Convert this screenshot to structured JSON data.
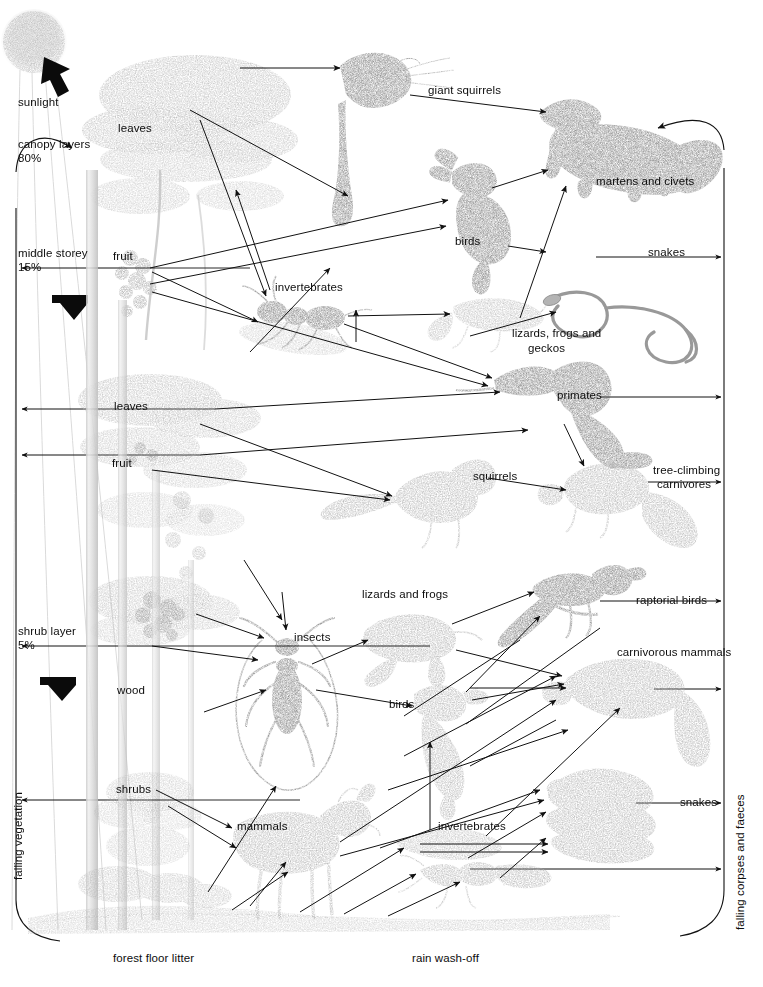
{
  "diagram": {
    "type": "food-web",
    "width": 763,
    "height": 987,
    "background": "#ffffff",
    "ink": "#0d0d0d",
    "sketch_tone": "#8c8c8c"
  },
  "labels": {
    "sunlight": "sunlight",
    "canopy_layers": "canopy layers",
    "canopy_pct": "80%",
    "middle_storey": "middle storey",
    "middle_pct": "15%",
    "shrub_layer": "shrub layer",
    "shrub_pct": "5%",
    "leaves_top": "leaves",
    "fruit_top": "fruit",
    "leaves_mid": "leaves",
    "fruit_mid": "fruit",
    "wood": "wood",
    "shrubs": "shrubs",
    "giant_squirrels": "giant squirrels",
    "martens_and_civets": "martens and civets",
    "birds_upper": "birds",
    "snakes_upper": "snakes",
    "invertebrates_upper": "invertebrates",
    "lizards_frogs_geckos_1": "lizards, frogs and",
    "lizards_frogs_geckos_2": "geckos",
    "primates": "primates",
    "squirrels": "squirrels",
    "tree_climbing_1": "tree-climbing",
    "tree_climbing_2": "carnivores",
    "insects": "insects",
    "lizards_and_frogs": "lizards and frogs",
    "raptorial_birds": "raptorial birds",
    "carnivorous_mammals": "carnivorous mammals",
    "birds_lower": "birds",
    "invertebrates_lower": "invertebrates",
    "mammals": "mammals",
    "snakes_lower": "snakes",
    "forest_floor_litter": "forest floor litter",
    "rain_wash_off": "rain wash-off",
    "falling_vegetation": "falling vegetation",
    "falling_corpses_and_faeces": "falling corpses and faeces"
  },
  "layers": [
    {
      "name": "canopy layers",
      "share": "80%"
    },
    {
      "name": "middle storey",
      "share": "15%"
    },
    {
      "name": "shrub layer",
      "share": "5%"
    }
  ],
  "producers": [
    {
      "id": "leaves-top",
      "label": "leaves",
      "layer": "canopy layers"
    },
    {
      "id": "fruit-top",
      "label": "fruit",
      "layer": "canopy layers"
    },
    {
      "id": "leaves-mid",
      "label": "leaves",
      "layer": "middle storey"
    },
    {
      "id": "fruit-mid",
      "label": "fruit",
      "layer": "middle storey"
    },
    {
      "id": "wood",
      "label": "wood",
      "layer": "shrub layer"
    },
    {
      "id": "shrubs",
      "label": "shrubs",
      "layer": "shrub layer"
    }
  ],
  "consumers": [
    {
      "id": "giant-squirrels",
      "label": "giant squirrels",
      "zone": "canopy"
    },
    {
      "id": "birds-upper",
      "label": "birds",
      "zone": "canopy"
    },
    {
      "id": "invertebrates-upper",
      "label": "invertebrates",
      "zone": "canopy"
    },
    {
      "id": "lizards-frogs-geckos",
      "label": "lizards, frogs and geckos",
      "zone": "canopy"
    },
    {
      "id": "primates",
      "label": "primates",
      "zone": "middle storey"
    },
    {
      "id": "squirrels",
      "label": "squirrels",
      "zone": "middle storey"
    },
    {
      "id": "martens-and-civets",
      "label": "martens and civets",
      "zone": "canopy"
    },
    {
      "id": "snakes-upper",
      "label": "snakes",
      "zone": "canopy"
    },
    {
      "id": "tree-climbing-carnivores",
      "label": "tree-climbing carnivores",
      "zone": "middle storey"
    },
    {
      "id": "insects",
      "label": "insects",
      "zone": "floor"
    },
    {
      "id": "lizards-and-frogs",
      "label": "lizards and frogs",
      "zone": "floor"
    },
    {
      "id": "birds-lower",
      "label": "birds",
      "zone": "floor"
    },
    {
      "id": "invertebrates-lower",
      "label": "invertebrates",
      "zone": "floor"
    },
    {
      "id": "mammals",
      "label": "mammals",
      "zone": "floor"
    },
    {
      "id": "raptorial-birds",
      "label": "raptorial birds",
      "zone": "floor"
    },
    {
      "id": "carnivorous-mammals",
      "label": "carnivorous mammals",
      "zone": "floor"
    },
    {
      "id": "snakes-lower",
      "label": "snakes",
      "zone": "floor"
    }
  ],
  "recycling": [
    {
      "id": "forest-floor-litter",
      "label": "forest floor litter"
    },
    {
      "id": "rain-wash-off",
      "label": "rain wash-off"
    },
    {
      "id": "falling-vegetation",
      "label": "falling vegetation"
    },
    {
      "id": "falling-corpses-and-faeces",
      "label": "falling corpses and faeces"
    }
  ]
}
